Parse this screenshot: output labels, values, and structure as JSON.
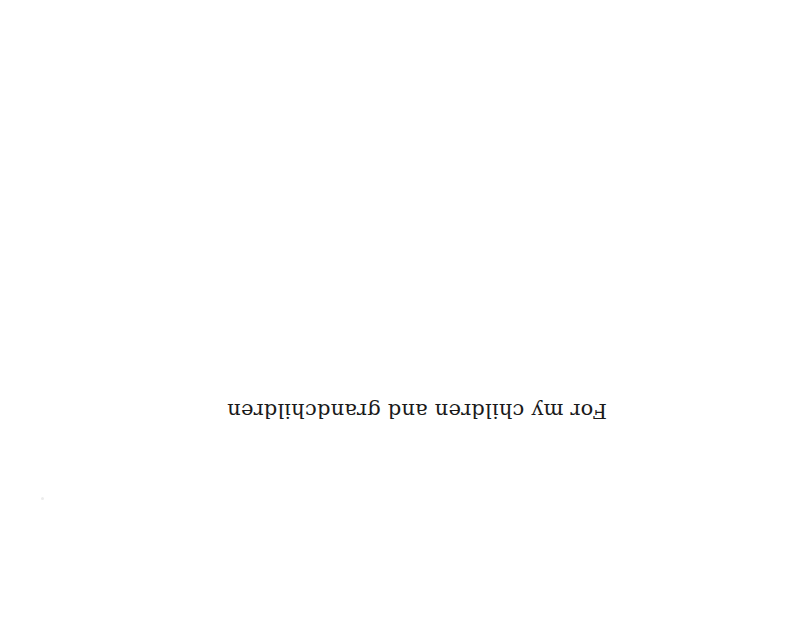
{
  "page": {
    "orientation": "rotated-180",
    "dedication": "For my children and grandchildren"
  }
}
